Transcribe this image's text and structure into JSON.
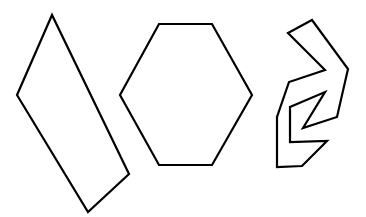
{
  "canvas": {
    "width": 366,
    "height": 217,
    "background": "#ffffff"
  },
  "stroke": {
    "color": "#000000",
    "width": 2.2
  },
  "shapes": [
    {
      "name": "quadrilateral",
      "points": "52,15 17,95 88,212 129,174"
    },
    {
      "name": "hexagon",
      "points": "159,24 212,24 252,95 212,165 159,165 120,95"
    },
    {
      "name": "irregular-polygon",
      "points": "288,33 312,20 348,69 337,117 303,128 325,92 290,107 290,142 327,141 302,166 277,167 277,117 289,82 325,70"
    }
  ]
}
